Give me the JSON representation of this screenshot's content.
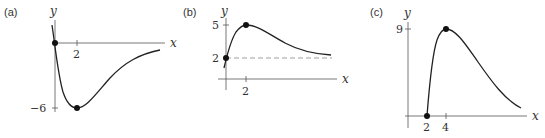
{
  "figure": {
    "panels": [
      {
        "id": "a",
        "label": "(a)",
        "x_axis_label": "x",
        "y_axis_label": "y",
        "x_ticks": [
          "2"
        ],
        "y_ticks": [
          "−6"
        ],
        "points": [
          {
            "x": 0,
            "y": 0
          },
          {
            "x": 2,
            "y": -6
          }
        ]
      },
      {
        "id": "b",
        "label": "(b)",
        "x_axis_label": "x",
        "y_axis_label": "y",
        "x_ticks": [
          "2"
        ],
        "y_ticks": [
          "5",
          "2"
        ],
        "asymptote": "y = 2 (dashed)",
        "points": [
          {
            "x": 0,
            "y": 2
          },
          {
            "x": 2,
            "y": 5
          }
        ]
      },
      {
        "id": "c",
        "label": "(c)",
        "x_axis_label": "x",
        "y_axis_label": "y",
        "x_ticks": [
          "2",
          "4"
        ],
        "y_ticks": [
          "9"
        ],
        "points": [
          {
            "x": 2,
            "y": 0
          },
          {
            "x": 4,
            "y": 9
          }
        ]
      }
    ]
  }
}
